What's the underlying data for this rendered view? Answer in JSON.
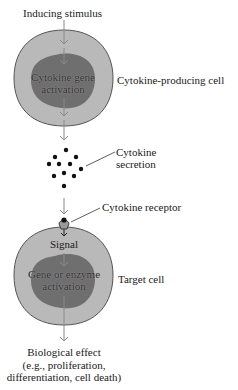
{
  "diagram": {
    "labels": {
      "inducing_stimulus": "Inducing stimulus",
      "producing_nucleus_line1": "Cytokine gene",
      "producing_nucleus_line2": "activation",
      "producing_cell": "Cytokine-producing cell",
      "secretion_line1": "Cytokine",
      "secretion_line2": "secretion",
      "receptor": "Cytokine receptor",
      "signal": "Signal",
      "target_nucleus_line1": "Gene or enzyme",
      "target_nucleus_line2": "activation",
      "target_cell": "Target cell",
      "effect_line1": "Biological effect",
      "effect_line2": "(e.g., proliferation,",
      "effect_line3": "differentiation, cell death)"
    },
    "colors": {
      "cell_fill": "#b9b9b9",
      "cell_stroke": "#555555",
      "nucleus_fill": "#6f6f6f",
      "arrow": "#8a8a8a",
      "dot": "#111111",
      "leader_line": "#333333"
    },
    "cytokine_dot_count": 11
  }
}
